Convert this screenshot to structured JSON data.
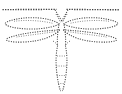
{
  "canvas": {
    "width": 122,
    "height": 94,
    "background_color": "#ffffff",
    "title": "Dragonfly dotted tracing outline"
  },
  "style": {
    "stroke_color": "#4a4a4a",
    "stroke_color_soft": "#6d6d6d",
    "stroke_color_fine": "#7c7c7c",
    "stroke_color_top": "#3f3f3f",
    "line_style": "dotted",
    "fill": "none"
  },
  "figure": {
    "subject": "dragonfly",
    "rendering": "dotted-outline-tracing",
    "parts": [
      {
        "id": "top-rule",
        "label": "Top horizontal dotted guide line",
        "kind": "line",
        "interactable": false
      },
      {
        "id": "head-vee",
        "label": "Head and antennae V shape",
        "kind": "path",
        "interactable": false
      },
      {
        "id": "wing-upper-left",
        "label": "Upper left wing",
        "kind": "lens",
        "interactable": false
      },
      {
        "id": "wing-upper-right",
        "label": "Upper right wing",
        "kind": "lens",
        "interactable": false
      },
      {
        "id": "wing-lower-left",
        "label": "Lower left wing",
        "kind": "lens",
        "interactable": false
      },
      {
        "id": "wing-lower-right",
        "label": "Lower right wing",
        "kind": "lens",
        "interactable": false
      },
      {
        "id": "thorax",
        "label": "Thorax",
        "kind": "path",
        "interactable": false
      },
      {
        "id": "abdomen",
        "label": "Abdomen and tail",
        "kind": "path",
        "interactable": false
      }
    ]
  }
}
